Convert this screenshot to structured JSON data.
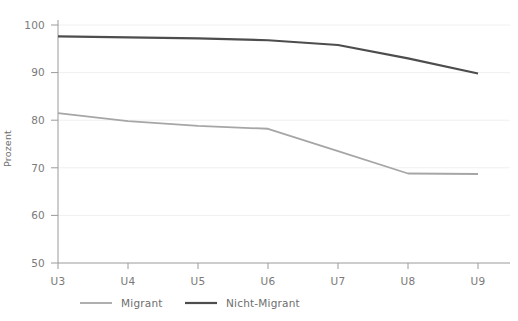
{
  "chart_data": {
    "type": "line",
    "title": "",
    "subtitle": "",
    "xlabel": "",
    "ylabel": "Prozent",
    "categories": [
      "U3",
      "U4",
      "U5",
      "U6",
      "U7",
      "U8",
      "U9"
    ],
    "x_tick_labels": [
      "U3",
      "U4",
      "U5",
      "U6",
      "U7",
      "U8",
      "U9"
    ],
    "y_tick_labels": [
      "50",
      "60",
      "70",
      "80",
      "90",
      "100"
    ],
    "y_ticks": [
      50,
      60,
      70,
      80,
      90,
      100
    ],
    "ylim": [
      50,
      100
    ],
    "grid": "horizontal-faint",
    "legend_position": "bottom",
    "series": [
      {
        "name": "Migrant",
        "color": "#a6a6a6",
        "width": 1.8,
        "values": [
          81.5,
          79.8,
          78.8,
          78.2,
          73.5,
          68.8,
          68.7
        ]
      },
      {
        "name": "Nicht-Migrant",
        "color": "#4d4d4d",
        "width": 2.2,
        "values": [
          97.6,
          97.4,
          97.2,
          96.8,
          95.8,
          93.0,
          89.8
        ]
      }
    ]
  },
  "legend": {
    "items": [
      {
        "label": "Migrant",
        "color": "#a6a6a6"
      },
      {
        "label": "Nicht-Migrant",
        "color": "#4d4d4d"
      }
    ]
  },
  "axes": {
    "y_axis_label": "Prozent",
    "axis_color": "#9a9a9a",
    "tick_color": "#7a7a7a",
    "grid_color": "#f0f0f0"
  }
}
